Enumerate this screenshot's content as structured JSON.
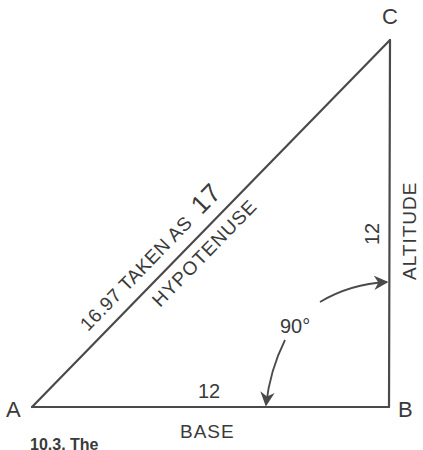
{
  "diagram": {
    "type": "right-triangle",
    "vertices": {
      "A": {
        "label": "A",
        "x": 32,
        "y": 407
      },
      "B": {
        "label": "B",
        "x": 389,
        "y": 407
      },
      "C": {
        "label": "C",
        "x": 390,
        "y": 40
      }
    },
    "sides": {
      "base": {
        "name": "BASE",
        "length": "12"
      },
      "altitude": {
        "name": "ALTITUDE",
        "length": "12"
      },
      "hypotenuse": {
        "name": "HYPOTENUSE",
        "length_text": "16.97 TAKEN AS",
        "rounded": "17"
      }
    },
    "angle": {
      "label": "90°"
    },
    "caption": "10.3. The"
  },
  "colors": {
    "line": "#4a4a4a",
    "text": "#3a3a3a",
    "background": "#ffffff"
  }
}
